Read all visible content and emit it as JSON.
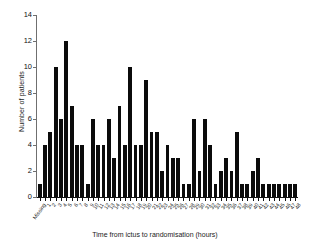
{
  "chart_data": {
    "type": "bar",
    "title": "",
    "subtitle": "",
    "xlabel": "Time from ictus to randomisation (hours)",
    "ylabel": "Number of patients",
    "ylim": [
      0,
      14
    ],
    "yticks": [
      0,
      2,
      4,
      6,
      8,
      10,
      12,
      14
    ],
    "ytick_labels": [
      "0",
      "2",
      "4",
      "6",
      "8",
      "10",
      "12",
      "14"
    ],
    "grid": false,
    "legend": null,
    "categories": [
      "Missing",
      "1",
      "2",
      "3",
      "4",
      "5",
      "6",
      "7",
      "8",
      "9",
      "10",
      "11",
      "12",
      "13",
      "14",
      "15",
      "16",
      "17",
      "18",
      "19",
      "20",
      "21",
      "22",
      "23",
      "24",
      "25",
      "26",
      "27",
      "28",
      "29",
      "30",
      "31",
      "32",
      "33",
      "34",
      "35",
      "36",
      "37",
      "38",
      "39",
      "40",
      "41",
      "42",
      "43",
      "44",
      "45",
      "46",
      "47",
      "48"
    ],
    "values": [
      1,
      4,
      5,
      10,
      6,
      12,
      7,
      4,
      4,
      1,
      6,
      4,
      4,
      6,
      3,
      7,
      4,
      10,
      4,
      4,
      9,
      5,
      5,
      2,
      4,
      3,
      3,
      1,
      1,
      6,
      2,
      6,
      4,
      1,
      2,
      3,
      2,
      5,
      1,
      1,
      2,
      3,
      1,
      1,
      1,
      1,
      1,
      1,
      1
    ],
    "bar_color": "#0b0b0b",
    "axis_color": "#6f6f6f"
  }
}
